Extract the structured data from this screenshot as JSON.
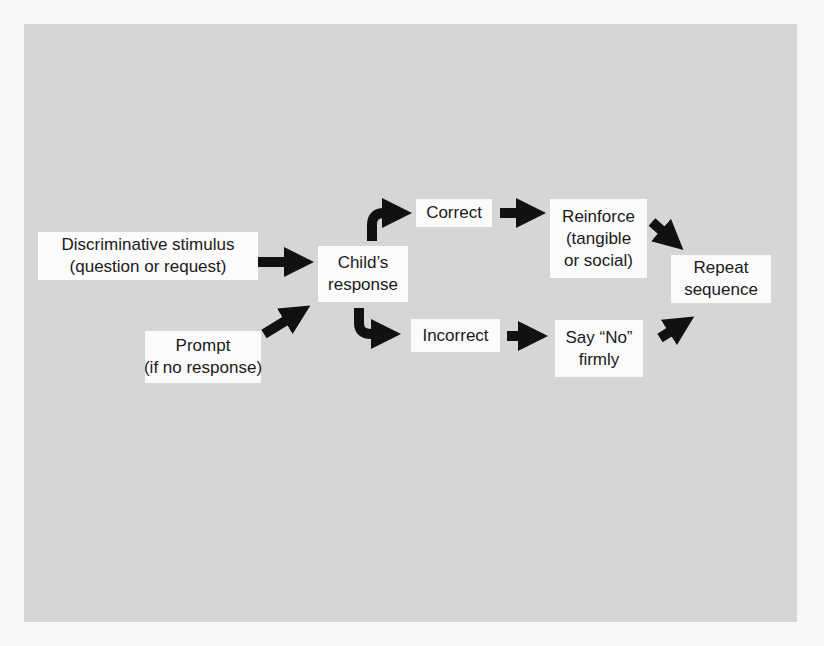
{
  "diagram": {
    "type": "flowchart",
    "nodes": {
      "discriminative_stimulus": {
        "line1": "Discriminative stimulus",
        "line2": "(question or request)"
      },
      "prompt": {
        "line1": "Prompt",
        "line2": "(if no response)"
      },
      "childs_response": {
        "line1": "Child’s",
        "line2": "response"
      },
      "correct": {
        "line1": "Correct"
      },
      "incorrect": {
        "line1": "Incorrect"
      },
      "reinforce": {
        "line1": "Reinforce",
        "line2": "(tangible",
        "line3": "or social)"
      },
      "say_no": {
        "line1": "Say “No”",
        "line2": "firmly"
      },
      "repeat": {
        "line1": "Repeat",
        "line2": "sequence"
      }
    },
    "edges": [
      {
        "from": "Discriminative stimulus",
        "to": "Child’s response"
      },
      {
        "from": "Prompt",
        "to": "Child’s response"
      },
      {
        "from": "Child’s response",
        "to": "Correct"
      },
      {
        "from": "Child’s response",
        "to": "Incorrect"
      },
      {
        "from": "Correct",
        "to": "Reinforce"
      },
      {
        "from": "Incorrect",
        "to": "Say “No” firmly"
      },
      {
        "from": "Reinforce",
        "to": "Repeat sequence"
      },
      {
        "from": "Say “No” firmly",
        "to": "Repeat sequence"
      }
    ],
    "colors": {
      "panel": "#d6d6d6",
      "box": "#fbfbfb",
      "arrow": "#111111",
      "page": "#f7f7f7"
    }
  }
}
